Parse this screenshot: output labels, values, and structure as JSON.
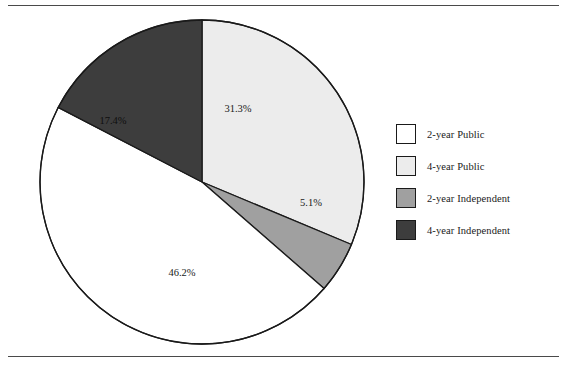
{
  "figure": {
    "background_color": "#ffffff",
    "rule_color": "#4a4a4a",
    "outline_color": "#1a1a1a"
  },
  "legend": {
    "position": "right",
    "items": [
      {
        "label": "2-year Public",
        "color": "#ffffff"
      },
      {
        "label": "4-year Public",
        "color": "#ececec"
      },
      {
        "label": "2-year Independent",
        "color": "#a0a0a0"
      },
      {
        "label": "4-year Independent",
        "color": "#3d3d3d"
      }
    ]
  },
  "chart_data": {
    "type": "pie",
    "title": "",
    "xlabel": "",
    "ylabel": "",
    "legend_position": "right",
    "grid": false,
    "start_angle_deg": 0,
    "direction": "clockwise",
    "center": {
      "x": 202,
      "y": 182
    },
    "radius": 162,
    "categories": [
      "2-year Public",
      "4-year Public",
      "2-year Independent",
      "4-year Independent"
    ],
    "values": [
      46.2,
      31.3,
      5.1,
      17.4
    ],
    "value_unit": "%",
    "colors": [
      "#ffffff",
      "#ececec",
      "#a0a0a0",
      "#3d3d3d"
    ],
    "slices": [
      {
        "label": "4-year Public",
        "value": 31.3,
        "display": "31.3%",
        "color": "#ececec",
        "start_deg": 0.0,
        "end_deg": 112.7,
        "label_x": 238,
        "label_y": 110
      },
      {
        "label": "2-year Independent",
        "value": 5.1,
        "display": "5.1%",
        "color": "#a0a0a0",
        "start_deg": 112.7,
        "end_deg": 131.1,
        "label_x": 311,
        "label_y": 204
      },
      {
        "label": "2-year Public",
        "value": 46.2,
        "display": "46.2%",
        "color": "#ffffff",
        "start_deg": 131.1,
        "end_deg": 297.4,
        "label_x": 182,
        "label_y": 274
      },
      {
        "label": "4-year Independent",
        "value": 17.4,
        "display": "17.4%",
        "color": "#3d3d3d",
        "start_deg": 297.4,
        "end_deg": 360.0,
        "label_x": 113,
        "label_y": 122
      }
    ]
  }
}
